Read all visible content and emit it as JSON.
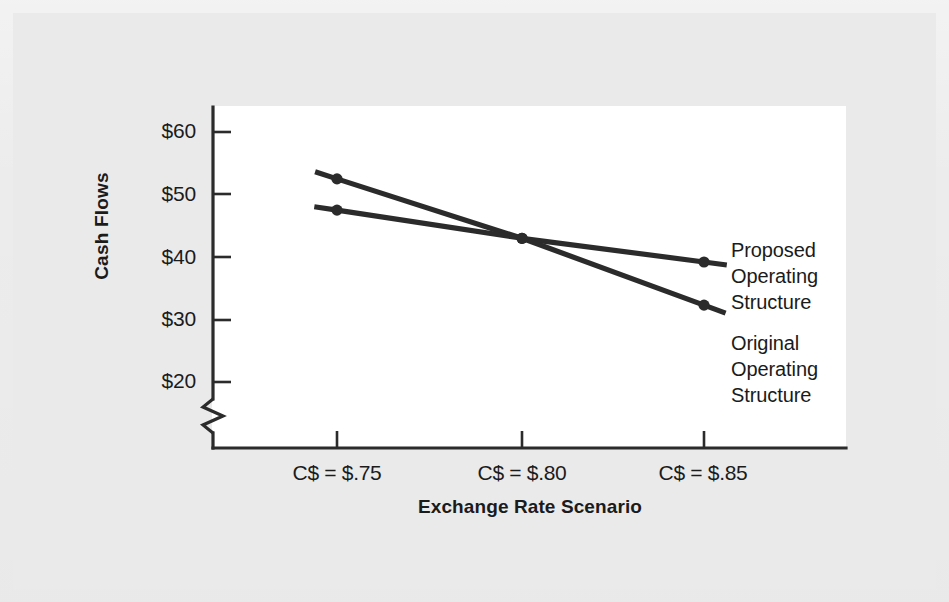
{
  "figure": {
    "background_color": "#eaeaeb",
    "plot_background_color": "#ffffff",
    "line_color": "#2b2b2b",
    "text_color": "#1b1b1b"
  },
  "chart_data": {
    "type": "line",
    "title": "",
    "xlabel": "Exchange Rate Scenario",
    "ylabel": "Cash Flows",
    "categories": [
      "C$ = $.75",
      "C$ = $.80",
      "C$ = $.85"
    ],
    "yticks": [
      "$20",
      "$30",
      "$40",
      "$50",
      "$60"
    ],
    "ytick_values": [
      20,
      30,
      40,
      50,
      60
    ],
    "ylim": [
      20,
      60
    ],
    "y_axis_break": true,
    "y_axis_break_note": "zigzag break below $20",
    "grid": false,
    "legend_position": "right",
    "series": [
      {
        "name": "Proposed Operating Structure",
        "values": [
          52.5,
          43.0,
          39.2
        ],
        "color": "#2b2b2b",
        "marker": "circle"
      },
      {
        "name": "Original Operating Structure",
        "values": [
          47.5,
          43.0,
          32.3
        ],
        "color": "#2b2b2b",
        "marker": "circle"
      }
    ]
  },
  "legend": {
    "proposed": "Proposed\nOperating\nStructure",
    "original": "Original\nOperating\nStructure"
  },
  "axis": {
    "ytick_0": "$60",
    "ytick_1": "$50",
    "ytick_2": "$40",
    "ytick_3": "$30",
    "ytick_4": "$20",
    "xtick_0": "C$ = $.75",
    "xtick_1": "C$ = $.80",
    "xtick_2": "C$ = $.85",
    "xlabel": "Exchange Rate Scenario",
    "ylabel": "Cash Flows"
  }
}
